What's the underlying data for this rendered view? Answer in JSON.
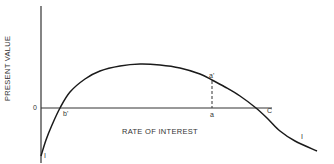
{
  "chart_data": {
    "type": "line",
    "title": "",
    "xlabel": "RATE OF INTEREST",
    "ylabel": "PRESENT VALUE",
    "grid": false,
    "legend": null,
    "axis_zero_label": "0",
    "series": [
      {
        "name": "I",
        "description": "Present value of investment as a function of rate of interest",
        "points_svg": [
          [
            41,
            156
          ],
          [
            46,
            140
          ],
          [
            52,
            125
          ],
          [
            60,
            108
          ],
          [
            70,
            92
          ],
          [
            85,
            79
          ],
          [
            100,
            71
          ],
          [
            120,
            66
          ],
          [
            140,
            64
          ],
          [
            160,
            65
          ],
          [
            180,
            68
          ],
          [
            200,
            74
          ],
          [
            212,
            80
          ],
          [
            225,
            87
          ],
          [
            240,
            96
          ],
          [
            256,
            108
          ],
          [
            268,
            119
          ],
          [
            280,
            131
          ],
          [
            295,
            141
          ],
          [
            317,
            151
          ]
        ]
      }
    ],
    "annotations": [
      {
        "label": "b'",
        "meaning": "zero crossing (internal rate) at low interest"
      },
      {
        "label": "C",
        "meaning": "zero crossing at high interest"
      },
      {
        "label": "a",
        "meaning": "selected rate on x-axis"
      },
      {
        "label": "a'",
        "meaning": "curve value at rate a (dashed vertical)"
      },
      {
        "label": "I",
        "meaning": "curve label near start"
      },
      {
        "label": "I",
        "meaning": "curve label near end"
      }
    ]
  },
  "labels": {
    "ylabel": "PRESENT VALUE",
    "xlabel": "RATE OF INTEREST",
    "zero": "0",
    "b_prime": "b'",
    "a": "a",
    "a_prime": "a'",
    "c": "C",
    "curve_start": "I",
    "curve_end": "I"
  }
}
